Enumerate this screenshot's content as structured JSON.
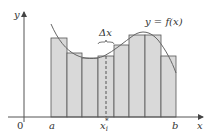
{
  "diagram": {
    "type": "riemann-sum",
    "axes": {
      "origin_label": "0",
      "x_label": "x",
      "y_label": "y"
    },
    "curve_label": "y = f(x)",
    "interval": {
      "start_label": "a",
      "end_label": "b"
    },
    "delta_label": "Δx",
    "sample_point_label": "x",
    "sample_point_sub": "i",
    "sample_point_sup": "*",
    "rectangles": [
      {
        "x": 51,
        "width": 16,
        "top": 38
      },
      {
        "x": 67,
        "width": 15,
        "top": 53
      },
      {
        "x": 82,
        "width": 16,
        "top": 58
      },
      {
        "x": 98,
        "width": 16,
        "top": 56
      },
      {
        "x": 114,
        "width": 15,
        "top": 45
      },
      {
        "x": 129,
        "width": 16,
        "top": 35
      },
      {
        "x": 145,
        "width": 16,
        "top": 35
      },
      {
        "x": 161,
        "width": 15,
        "top": 56
      }
    ],
    "colors": {
      "rect_fill": "#d9d9d9",
      "rect_stroke": "#555555",
      "curve": "#666666",
      "axis": "#555555",
      "text": "#333333"
    }
  }
}
